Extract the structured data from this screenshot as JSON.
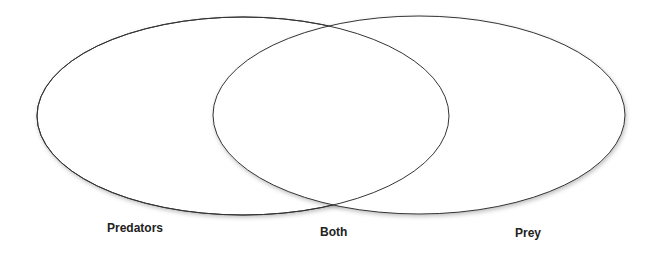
{
  "diagram": {
    "type": "venn",
    "sets": [
      {
        "label": "Predators"
      },
      {
        "label": "Prey"
      }
    ],
    "intersection_label": "Both",
    "stroke_color": "#333333",
    "fill_color": "#ffffff"
  }
}
